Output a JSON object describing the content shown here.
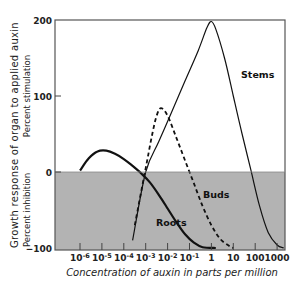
{
  "chart_data": {
    "type": "line",
    "title": "",
    "xlabel": "Concentration of auxin in parts per million",
    "ylabel": "Growth response of organ to applied auxin",
    "ylabel_upper": "Percent stimulation",
    "ylabel_lower": "Percent inhibition",
    "xscale": "log",
    "x_tick_labels": [
      "10^-6",
      "10^-5",
      "10^-4",
      "10^-3",
      "10^-2",
      "10^-1",
      "1",
      "10",
      "100",
      "1000"
    ],
    "x_tick_exponents": [
      -6,
      -5,
      -4,
      -3,
      -2,
      -1,
      0,
      1,
      2,
      3
    ],
    "y_ticks": [
      200,
      100,
      0,
      -100
    ],
    "ylim": [
      -100,
      200
    ],
    "shaded_region": {
      "from": -100,
      "to": 0,
      "color": "#b3b3b3",
      "meaning": "inhibition"
    },
    "grid": false,
    "legend": "inline labels",
    "series": [
      {
        "name": "Roots",
        "style": "solid-thick",
        "log10_x": [
          -6.0,
          -5.6,
          -5.2,
          -4.8,
          -4.4,
          -4.0,
          -3.6,
          -3.2,
          -2.8,
          -2.4,
          -2.0,
          -1.6,
          -1.2,
          -0.8,
          -0.4,
          0.2
        ],
        "values": [
          2,
          18,
          27,
          28,
          24,
          17,
          8,
          -2,
          -14,
          -30,
          -48,
          -66,
          -82,
          -93,
          -99,
          -100
        ]
      },
      {
        "name": "Buds",
        "style": "dashed",
        "log10_x": [
          -3.5,
          -3.3,
          -3.1,
          -2.9,
          -2.7,
          -2.5,
          -2.3,
          -2.0,
          -1.6,
          -1.2,
          -0.8,
          -0.4,
          0.0,
          0.4,
          0.8,
          1.0
        ],
        "values": [
          -70,
          -40,
          -10,
          20,
          50,
          74,
          84,
          74,
          45,
          15,
          -15,
          -45,
          -70,
          -88,
          -97,
          -100
        ]
      },
      {
        "name": "Stems",
        "style": "solid-thin",
        "log10_x": [
          -3.6,
          -3.0,
          -2.4,
          -1.8,
          -1.2,
          -0.6,
          -0.2,
          0.0,
          0.2,
          0.6,
          1.0,
          1.4,
          1.8,
          2.2,
          2.6,
          3.0,
          3.3
        ],
        "values": [
          -90,
          0,
          40,
          80,
          120,
          160,
          190,
          198,
          188,
          150,
          100,
          50,
          3,
          -45,
          -80,
          -96,
          -100
        ]
      }
    ],
    "annotations": [
      {
        "text": "Stems",
        "near": "right of stems peak"
      },
      {
        "text": "Buds",
        "near": "inhibition zone, between roots and stems"
      },
      {
        "text": "Roots",
        "near": "inhibition zone, lower left of roots curve"
      }
    ]
  }
}
